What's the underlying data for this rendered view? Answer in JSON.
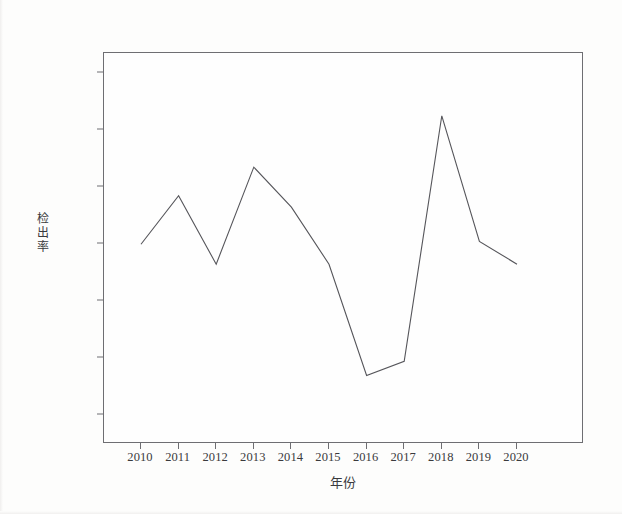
{
  "chart_data": {
    "type": "line",
    "title": "",
    "xlabel": "年份",
    "ylabel": "检出率",
    "categories": [
      "2010",
      "2011",
      "2012",
      "2013",
      "2014",
      "2015",
      "2016",
      "2017",
      "2018",
      "2019",
      "2020"
    ],
    "values": [
      0.14,
      0.157,
      0.133,
      0.167,
      0.153,
      0.133,
      0.094,
      0.099,
      0.185,
      0.141,
      0.133
    ],
    "series": [
      {
        "name": "检出率",
        "values": [
          0.14,
          0.157,
          0.133,
          0.167,
          0.153,
          0.133,
          0.094,
          0.099,
          0.185,
          0.141,
          0.133
        ]
      }
    ],
    "ylim": [
      0.07,
      0.207
    ],
    "xlim": [
      "2010",
      "2020"
    ],
    "ytick_labels": [
      "0.200",
      "0.180",
      "0.160",
      "0.140",
      "0.120",
      "0.100",
      "0.080"
    ],
    "ytick_values": [
      0.2,
      0.18,
      0.16,
      0.14,
      0.12,
      0.1,
      0.08
    ],
    "xtick_labels": [
      "2010",
      "2011",
      "2012",
      "2013",
      "2014",
      "2015",
      "2016",
      "2017",
      "2018",
      "2019",
      "2020"
    ],
    "grid": false,
    "legend": "none",
    "line_color": "#55555a",
    "markers": false,
    "annotations": []
  },
  "axes": {
    "y_title_chars": [
      "检",
      "出",
      "率"
    ],
    "y_ticks": [
      {
        "label": "0.200",
        "value": 0.2
      },
      {
        "label": "0.180",
        "value": 0.18
      },
      {
        "label": "0.160",
        "value": 0.16
      },
      {
        "label": "0.140",
        "value": 0.14
      },
      {
        "label": "0.120",
        "value": 0.12
      },
      {
        "label": "0.100",
        "value": 0.1
      },
      {
        "label": "0.080",
        "value": 0.08
      }
    ],
    "x_ticks": [
      {
        "label": "2010"
      },
      {
        "label": "2011"
      },
      {
        "label": "2012"
      },
      {
        "label": "2013"
      },
      {
        "label": "2014"
      },
      {
        "label": "2015"
      },
      {
        "label": "2016"
      },
      {
        "label": "2017"
      },
      {
        "label": "2018"
      },
      {
        "label": "2019"
      },
      {
        "label": "2020"
      }
    ],
    "x_title": "年份"
  }
}
